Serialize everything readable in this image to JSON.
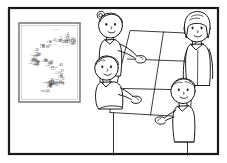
{
  "illustration": {
    "title": "Classroom scene with dot-to-dot poster and perspective grid",
    "style": "black and white cartoon line drawing",
    "stroke_color": "#1a1a1a",
    "fill_color": "#ffffff",
    "background_color": "#ffffff"
  },
  "frame": {
    "name": "outer-frame",
    "border_color": "#1a1a1a",
    "border_width_px": 2,
    "margin_px": 8
  },
  "poster": {
    "name": "dot-to-dot-number-poster",
    "border_color": "#555555",
    "fill_color": "#ffffff",
    "caption": "",
    "numbers": [
      "1",
      "2",
      "3",
      "4",
      "5",
      "6",
      "7",
      "8",
      "9",
      "10",
      "11",
      "12",
      "13",
      "14",
      "15",
      "16",
      "17",
      "18",
      "19",
      "20",
      "21",
      "22",
      "23",
      "24",
      "25",
      "26",
      "27",
      "28",
      "29",
      "30",
      "31",
      "32",
      "33",
      "34",
      "35",
      "36",
      "37",
      "38",
      "39",
      "40",
      "41",
      "42",
      "43",
      "44",
      "45",
      "46",
      "47",
      "48",
      "49",
      "50",
      "51",
      "52",
      "53",
      "54",
      "55",
      "56",
      "57",
      "58",
      "59",
      "60",
      "61",
      "62",
      "63",
      "64",
      "65",
      "66",
      "67",
      "68",
      "69",
      "70",
      "71",
      "72",
      "73",
      "74",
      "75",
      "76",
      "77",
      "78",
      "79",
      "80",
      "81",
      "82",
      "83",
      "84",
      "85",
      "86",
      "87",
      "88",
      "89",
      "90",
      "91",
      "92",
      "93",
      "94",
      "95",
      "96",
      "97",
      "98",
      "99",
      "100"
    ]
  },
  "grid": {
    "name": "perspective-table-grid",
    "columns": 2,
    "rows": 3,
    "legs": 2,
    "line_color": "#1a1a1a"
  },
  "figures": [
    {
      "name": "figure-standing-left",
      "position": "top-left-center",
      "pose": "standing, right arm extended toward grid",
      "hair": "short with curl on left side"
    },
    {
      "name": "figure-seated-left",
      "position": "middle-left",
      "pose": "seated, arm extended toward grid",
      "hair": "short"
    },
    {
      "name": "figure-standing-right",
      "position": "top-right",
      "pose": "standing at right edge",
      "hair": "long"
    },
    {
      "name": "figure-standing-lower-right",
      "position": "lower-right",
      "pose": "standing, hand gesturing toward grid",
      "hair": "short"
    }
  ]
}
